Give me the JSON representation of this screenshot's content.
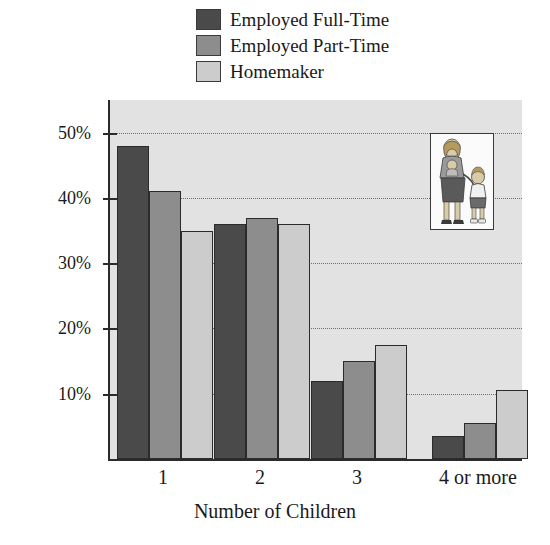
{
  "chart_data": {
    "type": "bar",
    "title": "",
    "xlabel": "Number of Children",
    "ylabel": "Percent of Mothers with Job Status",
    "categories": [
      "1",
      "2",
      "3",
      "4 or more"
    ],
    "series": [
      {
        "name": "Employed Full-Time",
        "color": "#4a4a4a",
        "values": [
          48,
          36,
          12,
          3.5
        ]
      },
      {
        "name": "Employed Part-Time",
        "color": "#8d8d8d",
        "values": [
          41,
          37,
          15,
          5.5
        ]
      },
      {
        "name": "Homemaker",
        "color": "#cccccc",
        "values": [
          35,
          36,
          17.5,
          10.5
        ]
      }
    ],
    "ylim": [
      0,
      55
    ],
    "ytick_values": [
      10,
      20,
      30,
      40,
      50
    ],
    "ytick_labels": [
      "10%",
      "20%",
      "30%",
      "40%",
      "50%"
    ],
    "grid": true,
    "legend_position": "top-center",
    "plot_background": "#e2e2e2",
    "axis_color": "#2b2b2b"
  },
  "inset": {
    "name": "mother-with-children-illustration",
    "alt": "Illustration of a mother holding a baby and holding hands with a child"
  }
}
